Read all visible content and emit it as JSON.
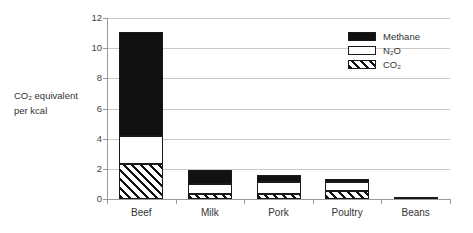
{
  "chart_data": {
    "type": "bar",
    "subtype": "stacked-bar",
    "title": "",
    "xlabel": "",
    "ylabel": "CO2 equivalent per kcal",
    "ylabel_line1": "CO₂ equivalent",
    "ylabel_line2": "per kcal",
    "ylim": [
      0,
      12
    ],
    "yticks": [
      0,
      2,
      4,
      6,
      8,
      10,
      12
    ],
    "ytick_labels": [
      "0",
      "2",
      "4",
      "6",
      "8",
      "10",
      "12"
    ],
    "grid": "horizontal",
    "legend_position": "upper-right",
    "categories": [
      "Beef",
      "Milk",
      "Pork",
      "Poultry",
      "Beans"
    ],
    "stack_order_bottom_to_top": [
      "CO2",
      "N2O",
      "Methane"
    ],
    "series": [
      {
        "name": "CO2",
        "label": "CO₂",
        "fill": "diagonal-hatch",
        "color": "#111111",
        "values": [
          2.3,
          0.3,
          0.3,
          0.55,
          0.1
        ]
      },
      {
        "name": "N2O",
        "label": "N₂O",
        "fill": "empty",
        "color": "#ffffff",
        "values": [
          1.9,
          0.7,
          0.85,
          0.55,
          0.0
        ]
      },
      {
        "name": "Methane",
        "label": "Methane",
        "fill": "solid",
        "color": "#111111",
        "values": [
          6.9,
          0.9,
          0.45,
          0.2,
          0.0
        ]
      }
    ],
    "totals": [
      11.1,
      1.9,
      1.6,
      1.3,
      0.1
    ]
  },
  "legend": {
    "items": [
      {
        "label": "Methane"
      },
      {
        "label": "N₂O"
      },
      {
        "label": "CO₂"
      }
    ]
  },
  "axes": {
    "y_title_line1": "CO₂ equivalent",
    "y_title_line2": "per kcal"
  }
}
